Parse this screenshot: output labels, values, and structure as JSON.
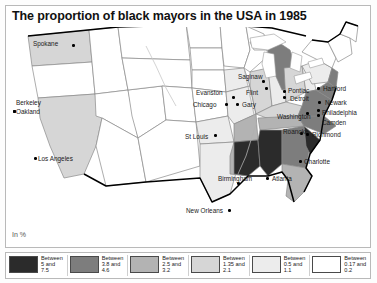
{
  "title": "The proportion of black mayors in the USA in 1985",
  "units_label": "In %",
  "legend": {
    "items": [
      {
        "label_line1": "Between",
        "label_line2": "5 and",
        "label_line3": "7.5",
        "color": "#2b2b2b"
      },
      {
        "label_line1": "Between",
        "label_line2": "3.8 and",
        "label_line3": "4.6",
        "color": "#7d7d7d"
      },
      {
        "label_line1": "Between",
        "label_line2": "2.5 and",
        "label_line3": "3.2",
        "color": "#b3b3b3"
      },
      {
        "label_line1": "Between",
        "label_line2": "1.35 and",
        "label_line3": "2.1",
        "color": "#d6d6d6"
      },
      {
        "label_line1": "Between",
        "label_line2": "0.5 and",
        "label_line3": "1.1",
        "color": "#ececec"
      },
      {
        "label_line1": "Between",
        "label_line2": "0.17 and",
        "label_line3": "0.2",
        "color": "#ffffff"
      }
    ]
  },
  "cities": [
    {
      "name": "Spokane",
      "lx": 33,
      "ly": 40,
      "dx": 72,
      "dy": 44,
      "align": "left"
    },
    {
      "name": "Berkeley",
      "lx": 16,
      "ly": 99,
      "dx": 13,
      "dy": 110,
      "align": "left"
    },
    {
      "name": "Oakland",
      "lx": 16,
      "ly": 108,
      "dx": 13,
      "dy": 110,
      "align": "left"
    },
    {
      "name": "Los Angeles",
      "lx": 38,
      "ly": 155,
      "dx": 34,
      "dy": 157,
      "align": "left"
    },
    {
      "name": "Saginaw",
      "lx": 238,
      "ly": 73,
      "dx": 262,
      "dy": 80,
      "align": "left"
    },
    {
      "name": "Evanston",
      "lx": 196,
      "ly": 89,
      "dx": 232,
      "dy": 96,
      "align": "left"
    },
    {
      "name": "Flint",
      "lx": 246,
      "ly": 89,
      "dx": 265,
      "dy": 87,
      "align": "left"
    },
    {
      "name": "Pontiac",
      "lx": 288,
      "ly": 87,
      "dx": 283,
      "dy": 90,
      "align": "left"
    },
    {
      "name": "Detroit",
      "lx": 290,
      "ly": 95,
      "dx": 283,
      "dy": 96,
      "align": "left"
    },
    {
      "name": "Chicago",
      "lx": 193,
      "ly": 101,
      "dx": 225,
      "dy": 103,
      "align": "left"
    },
    {
      "name": "Gary",
      "lx": 242,
      "ly": 101,
      "dx": 236,
      "dy": 103,
      "align": "left"
    },
    {
      "name": "Hartford",
      "lx": 323,
      "ly": 85,
      "dx": 317,
      "dy": 87,
      "align": "left"
    },
    {
      "name": "Newark",
      "lx": 325,
      "ly": 99,
      "dx": 318,
      "dy": 101,
      "align": "left"
    },
    {
      "name": "Philadelphia",
      "lx": 322,
      "ly": 109,
      "dx": 317,
      "dy": 109,
      "align": "left"
    },
    {
      "name": "Camden",
      "lx": 322,
      "ly": 119,
      "dx": 317,
      "dy": 114,
      "align": "left"
    },
    {
      "name": "Washington",
      "lx": 277,
      "ly": 113,
      "dx": 306,
      "dy": 112,
      "align": "left"
    },
    {
      "name": "St Louis",
      "lx": 185,
      "ly": 133,
      "dx": 214,
      "dy": 134,
      "align": "left"
    },
    {
      "name": "Roanoke",
      "lx": 283,
      "ly": 128,
      "dx": 300,
      "dy": 132,
      "align": "left"
    },
    {
      "name": "Richmond",
      "lx": 312,
      "ly": 131,
      "dx": 306,
      "dy": 133,
      "align": "left"
    },
    {
      "name": "Charlotte",
      "lx": 304,
      "ly": 158,
      "dx": 299,
      "dy": 160,
      "align": "left"
    },
    {
      "name": "Birmingham",
      "lx": 218,
      "ly": 175,
      "dx": 237,
      "dy": 182,
      "align": "left"
    },
    {
      "name": "Atlanta",
      "lx": 272,
      "ly": 175,
      "dx": 266,
      "dy": 177,
      "align": "left"
    },
    {
      "name": "New Orleans",
      "lx": 186,
      "ly": 207,
      "dx": 228,
      "dy": 209,
      "align": "left"
    }
  ],
  "map_colors": {
    "darkest": "#2b2b2b",
    "dark": "#7d7d7d",
    "medium": "#b3b3b3",
    "light": "#d6d6d6",
    "lighter": "#ececec",
    "lightest": "#ffffff",
    "border": "#6f6f6f",
    "coast": "#000000"
  }
}
